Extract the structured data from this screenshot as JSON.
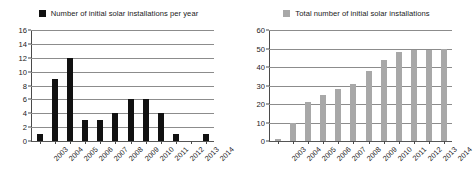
{
  "chart_data": [
    {
      "type": "bar",
      "panel": "left",
      "title": "",
      "legend": {
        "label": "Number of initial solar installations per year",
        "color": "#111111",
        "position": "top-center"
      },
      "categories": [
        "2003",
        "2004",
        "2005",
        "2006",
        "2007",
        "2008",
        "2009",
        "2010",
        "2011",
        "2012",
        "2013",
        "2014"
      ],
      "values": [
        1,
        9,
        12,
        3,
        3,
        4,
        6,
        6,
        4,
        1,
        0,
        1
      ],
      "series": [
        {
          "name": "Number of initial solar installations per year",
          "values": [
            1,
            9,
            12,
            3,
            3,
            4,
            6,
            6,
            4,
            1,
            0,
            1
          ],
          "color": "#111111"
        }
      ],
      "xlabel": "",
      "ylabel": "",
      "ylim": [
        0,
        16
      ],
      "yticks": [
        0,
        2,
        4,
        6,
        8,
        10,
        12,
        14,
        16
      ],
      "ytick_labels": [
        "0",
        "2",
        "4",
        "6",
        "8",
        "10",
        "12",
        "14",
        "16"
      ],
      "grid": true,
      "xtick_rotation": -45
    },
    {
      "type": "bar",
      "panel": "right",
      "title": "",
      "legend": {
        "label": "Total number of initial solar installations",
        "color": "#a8a8a8",
        "position": "top-center"
      },
      "categories": [
        "2003",
        "2004",
        "2005",
        "2006",
        "2007",
        "2008",
        "2009",
        "2010",
        "2011",
        "2012",
        "2013",
        "2014"
      ],
      "values": [
        1,
        10,
        21,
        25,
        28,
        31,
        38,
        44,
        48,
        49,
        49,
        50
      ],
      "series": [
        {
          "name": "Total number of initial solar installations",
          "values": [
            1,
            10,
            21,
            25,
            28,
            31,
            38,
            44,
            48,
            49,
            49,
            50
          ],
          "color": "#a8a8a8"
        }
      ],
      "xlabel": "",
      "ylabel": "",
      "ylim": [
        0,
        60
      ],
      "yticks": [
        0,
        10,
        20,
        30,
        40,
        50,
        60
      ],
      "ytick_labels": [
        "0",
        "10",
        "20",
        "30",
        "40",
        "50",
        "60"
      ],
      "grid": true,
      "xtick_rotation": -45
    }
  ],
  "colors": {
    "bar_dark": "#111111",
    "bar_gray": "#a8a8a8",
    "gridline": "#8c8c8c",
    "axis": "#4a4a4a",
    "text": "#1a1a1a",
    "background": "#ffffff"
  }
}
